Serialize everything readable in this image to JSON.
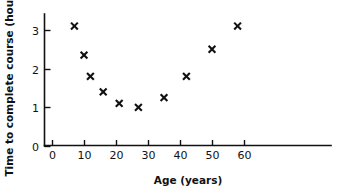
{
  "chart_data": {
    "type": "scatter",
    "title": "",
    "xlabel": "Age (years)",
    "ylabel": "Time to complete course (hours)",
    "xlim": [
      0,
      65
    ],
    "ylim": [
      0,
      3.45
    ],
    "xticks": [
      0,
      10,
      20,
      30,
      40,
      50,
      60
    ],
    "xticklabels": [
      "0",
      "10",
      "20",
      "30",
      "40",
      "50",
      "60"
    ],
    "yticks": [
      0,
      1,
      2,
      3
    ],
    "yticklabels": [
      "0",
      "1",
      "2",
      "3"
    ],
    "grid": false,
    "legend": false,
    "marker": "x",
    "marker_color": "#111111",
    "points": [
      {
        "x": 7,
        "y": 3.1
      },
      {
        "x": 10,
        "y": 2.35
      },
      {
        "x": 12,
        "y": 1.8
      },
      {
        "x": 16,
        "y": 1.4
      },
      {
        "x": 21,
        "y": 1.1
      },
      {
        "x": 27,
        "y": 1.0
      },
      {
        "x": 35,
        "y": 1.25
      },
      {
        "x": 42,
        "y": 1.8
      },
      {
        "x": 50,
        "y": 2.5
      },
      {
        "x": 58,
        "y": 3.1
      }
    ],
    "x": [
      7,
      10,
      12,
      16,
      21,
      27,
      35,
      42,
      50,
      58
    ],
    "values": [
      3.1,
      2.35,
      1.8,
      1.4,
      1.1,
      1.0,
      1.25,
      1.8,
      2.5,
      3.1
    ]
  },
  "axes": {
    "x_axis_name": "x-axis",
    "y_axis_name": "y-axis"
  },
  "colors": {
    "ink": "#111111",
    "background": "#ffffff"
  }
}
